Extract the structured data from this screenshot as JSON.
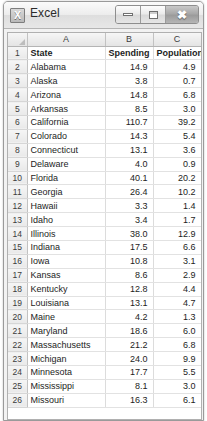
{
  "window": {
    "title": "Excel",
    "app_icon": "excel-x-icon",
    "controls": {
      "minimize": "minimize-icon",
      "maximize": "maximize-icon",
      "close": "close-icon"
    }
  },
  "sheet": {
    "corner_label": "",
    "column_headers": [
      "A",
      "B",
      "C"
    ],
    "row_numbers": [
      1,
      2,
      3,
      4,
      5,
      6,
      7,
      8,
      9,
      10,
      11,
      12,
      13,
      14,
      15,
      16,
      17,
      18,
      19,
      20,
      21,
      22,
      23,
      24,
      25,
      26
    ],
    "header_row": {
      "a": "State",
      "b": "Spending",
      "c": "Population"
    },
    "rows": [
      {
        "state": "Alabama",
        "spending": "14.9",
        "population": "4.9"
      },
      {
        "state": "Alaska",
        "spending": "3.8",
        "population": "0.7"
      },
      {
        "state": "Arizona",
        "spending": "14.8",
        "population": "6.8"
      },
      {
        "state": "Arkansas",
        "spending": "8.5",
        "population": "3.0"
      },
      {
        "state": "California",
        "spending": "110.7",
        "population": "39.2"
      },
      {
        "state": "Colorado",
        "spending": "14.3",
        "population": "5.4"
      },
      {
        "state": "Connecticut",
        "spending": "13.1",
        "population": "3.6"
      },
      {
        "state": "Delaware",
        "spending": "4.0",
        "population": "0.9"
      },
      {
        "state": "Florida",
        "spending": "40.1",
        "population": "20.2"
      },
      {
        "state": "Georgia",
        "spending": "26.4",
        "population": "10.2"
      },
      {
        "state": "Hawaii",
        "spending": "3.3",
        "population": "1.4"
      },
      {
        "state": "Idaho",
        "spending": "3.4",
        "population": "1.7"
      },
      {
        "state": "Illinois",
        "spending": "38.0",
        "population": "12.9"
      },
      {
        "state": "Indiana",
        "spending": "17.5",
        "population": "6.6"
      },
      {
        "state": "Iowa",
        "spending": "10.8",
        "population": "3.1"
      },
      {
        "state": "Kansas",
        "spending": "8.6",
        "population": "2.9"
      },
      {
        "state": "Kentucky",
        "spending": "12.8",
        "population": "4.4"
      },
      {
        "state": "Louisiana",
        "spending": "13.1",
        "population": "4.7"
      },
      {
        "state": "Maine",
        "spending": "4.2",
        "population": "1.3"
      },
      {
        "state": "Maryland",
        "spending": "18.6",
        "population": "6.0"
      },
      {
        "state": "Massachusetts",
        "spending": "21.2",
        "population": "6.8"
      },
      {
        "state": "Michigan",
        "spending": "24.0",
        "population": "9.9"
      },
      {
        "state": "Minnesota",
        "spending": "17.7",
        "population": "5.5"
      },
      {
        "state": "Mississippi",
        "spending": "8.1",
        "population": "3.0"
      },
      {
        "state": "Missouri",
        "spending": "16.3",
        "population": "6.1"
      }
    ]
  }
}
